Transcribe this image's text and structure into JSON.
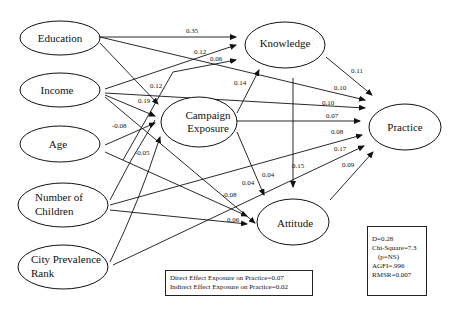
{
  "diagram": {
    "type": "path-analysis",
    "nodes": {
      "education": {
        "label": "Education"
      },
      "income": {
        "label": "Income"
      },
      "age": {
        "label": "Age"
      },
      "children": {
        "label1": "Number of",
        "label2": "Children"
      },
      "city": {
        "label1": "City Prevalence",
        "label2": "Rank"
      },
      "campaign": {
        "label1": "Campaign",
        "label2": "Exposure"
      },
      "knowledge": {
        "label": "Knowledge"
      },
      "attitude": {
        "label": "Attitude"
      },
      "practice": {
        "label": "Practice"
      }
    },
    "edges": [
      {
        "from": "Education",
        "to": "Knowledge",
        "coef": "0.35"
      },
      {
        "from": "Income",
        "to": "Knowledge",
        "coef": "0.12"
      },
      {
        "from": "Campaign Exposure",
        "to": "Knowledge",
        "coef": "0.06"
      },
      {
        "from": "Education",
        "to": "Campaign Exposure",
        "coef": "0.12"
      },
      {
        "from": "Income",
        "to": "Campaign Exposure",
        "coef": "0.19"
      },
      {
        "from": "Age",
        "to": "Campaign Exposure",
        "coef": "-0.08"
      },
      {
        "from": "City Prevalence Rank",
        "to": "Campaign Exposure",
        "coef": "-0.05"
      },
      {
        "from": "Campaign Exposure",
        "to": "Knowledge",
        "coef": "0.14"
      },
      {
        "from": "Knowledge",
        "to": "Practice",
        "coef": "0.11"
      },
      {
        "from": "Education",
        "to": "Practice",
        "coef": "0.10"
      },
      {
        "from": "Income",
        "to": "Practice",
        "coef": "0.10"
      },
      {
        "from": "Campaign Exposure",
        "to": "Practice",
        "coef": "0.07"
      },
      {
        "from": "Number of Children",
        "to": "Practice",
        "coef": "0.08"
      },
      {
        "from": "City Prevalence Rank",
        "to": "Practice",
        "coef": "0.17"
      },
      {
        "from": "Attitude",
        "to": "Practice",
        "coef": "0.09"
      },
      {
        "from": "Knowledge",
        "to": "Attitude",
        "coef": "0.15"
      },
      {
        "from": "Campaign Exposure",
        "to": "Attitude",
        "coef": "0.04"
      },
      {
        "from": "Income",
        "to": "Attitude",
        "coef": "0.04"
      },
      {
        "from": "Age",
        "to": "Attitude",
        "coef": "-0.08"
      },
      {
        "from": "Number of Children",
        "to": "Attitude",
        "coef": "0.06"
      }
    ]
  },
  "effects_box": {
    "line1": "Direct Effect Exposure on Practice=0.07",
    "line2": "Indirect Effect Exposure on Practice=0.02"
  },
  "fit_box": {
    "d": "D=0.28",
    "chi": "Chi-Square=7.3",
    "p": "(p=NS)",
    "agfi": "AGFI=.996",
    "rmsr": "RMSR=0.007"
  },
  "labels": {
    "c035": "0.35",
    "c012a": "0.12",
    "c006a": "0.06",
    "c012b": "0.12",
    "c019": "0.19",
    "c008n": "-0.08",
    "c005n": "-0.05",
    "c014": "0.14",
    "c011": "0.11",
    "c010a": "0.10",
    "c010b": "0.10",
    "c007": "0.07",
    "c008": "0.08",
    "c017": "0.17",
    "c009": "0.09",
    "c015": "0.15",
    "c004a": "0.04",
    "c004b": "0.04",
    "c008n2": "-0.08",
    "c006b": "0.06"
  }
}
